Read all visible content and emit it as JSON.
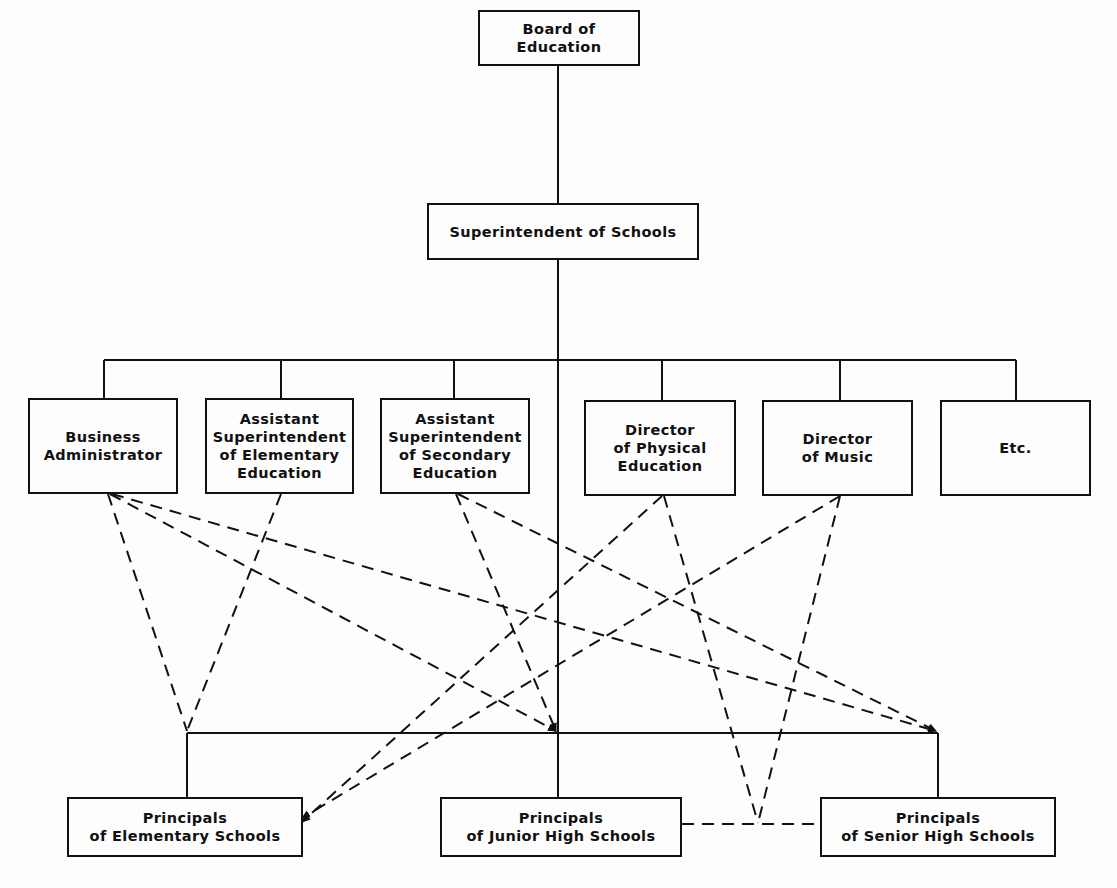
{
  "chart_title": "",
  "nodes": {
    "board": {
      "label": "Board of Education"
    },
    "superintendent": {
      "label": "Superintendent of Schools"
    },
    "business_admin": {
      "label": "Business\nAdministrator"
    },
    "asst_elem": {
      "label": "Assistant\nSuperintendent\nof Elementary\nEducation"
    },
    "asst_sec": {
      "label": "Assistant\nSuperintendent\nof Secondary\nEducation"
    },
    "dir_phys_ed": {
      "label": "Director\nof Physical\nEducation"
    },
    "dir_music": {
      "label": "Director\nof Music"
    },
    "etc": {
      "label": "Etc."
    },
    "prin_elem": {
      "label": "Principals\nof Elementary Schools"
    },
    "prin_junior": {
      "label": "Principals\nof Junior High Schools"
    },
    "prin_senior": {
      "label": "Principals\nof Senior High Schools"
    }
  },
  "colors": {
    "line": "#111111",
    "background": "#fdfdfd"
  },
  "legend": {
    "solid_line": "line authority",
    "dashed_line": "staff / advisory relationship"
  }
}
